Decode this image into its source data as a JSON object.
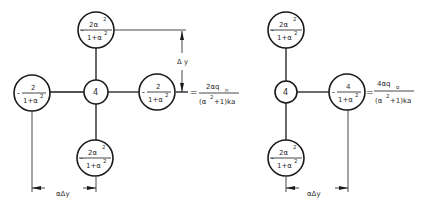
{
  "left_stencil": {
    "top": {
      "num": "2α",
      "num_sup": "2",
      "den": "1+α",
      "den_sup": "2",
      "sign": "-"
    },
    "left": {
      "num": "2",
      "den": "1+α",
      "den_sup": "2",
      "sign": "-"
    },
    "center": {
      "value": "4"
    },
    "right": {
      "num": "2",
      "den": "1+α",
      "den_sup": "2",
      "sign": "-"
    },
    "bottom": {
      "num": "2α",
      "num_sup": "2",
      "den": "1+α",
      "den_sup": "2",
      "sign": "-"
    },
    "equation": {
      "eq": "=",
      "num": "2αq",
      "num_sub": "n",
      "den_pre": "(α",
      "den_sup": "2",
      "den_post": "+1)ka"
    },
    "vertical_dim_label": "Δ y",
    "horizontal_dim_label": "αΔy"
  },
  "right_stencil": {
    "top": {
      "num": "2α",
      "num_sup": "2",
      "den": "1+α",
      "den_sup": "2",
      "sign": "-"
    },
    "center": {
      "value": "4"
    },
    "right": {
      "num": "4",
      "den": "1+α",
      "den_sup": "2",
      "sign": "-"
    },
    "bottom": {
      "num": "2α",
      "num_sup": "2",
      "den": "1+α",
      "den_sup": "2",
      "sign": "-"
    },
    "equation": {
      "eq": "=",
      "num": "4αq",
      "num_sub": "o",
      "den_pre": "(α",
      "den_sup": "2",
      "den_post": "+1)ka"
    },
    "horizontal_dim_label": "αΔy"
  },
  "colors": {
    "line": "#1a1a1a",
    "text": "#2a2a2a",
    "background": "#ffffff"
  }
}
